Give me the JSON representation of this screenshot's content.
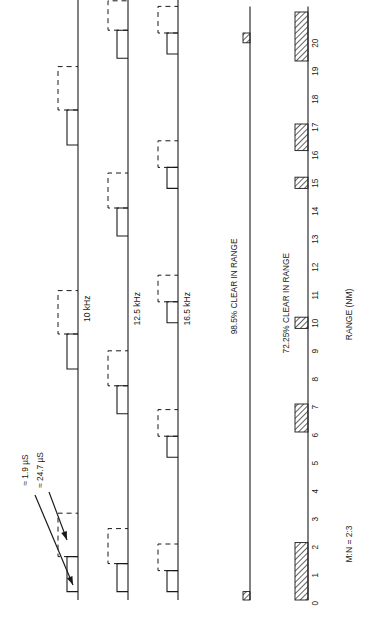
{
  "figure": {
    "orientation": "rotated-90-ccw",
    "axis_label": "RANGE (NM)",
    "ratio_note": "M:N = 2:3",
    "colors": {
      "ink": "#1a1a1a",
      "hatch": "#333333",
      "paper": "#ffffff"
    }
  },
  "annotations": [
    {
      "id": "pulse-width",
      "label": "≈ 1.9  µS"
    },
    {
      "id": "pulse-period",
      "label": "≈ 24.7 µS"
    }
  ],
  "traces": [
    {
      "name": "trace-10khz",
      "label": "10 kHz",
      "solid_pulses": [
        {
          "start": 0.3,
          "end": 1.55
        },
        {
          "start": 8.25,
          "end": 9.5
        },
        {
          "start": 16.25,
          "end": 17.5
        }
      ],
      "dashed_pulses": [
        {
          "start": 1.55,
          "end": 3.1
        },
        {
          "start": 9.5,
          "end": 11.05
        },
        {
          "start": 17.5,
          "end": 19.05
        }
      ]
    },
    {
      "name": "trace-12_5khz",
      "label": "12.5 kHz",
      "solid_pulses": [
        {
          "start": 0.3,
          "end": 1.3
        },
        {
          "start": 6.65,
          "end": 7.65
        },
        {
          "start": 13.0,
          "end": 14.0
        },
        {
          "start": 19.35,
          "end": 20.35
        }
      ],
      "dashed_pulses": [
        {
          "start": 1.3,
          "end": 2.55
        },
        {
          "start": 7.65,
          "end": 8.9
        },
        {
          "start": 14.0,
          "end": 15.25
        },
        {
          "start": 20.35,
          "end": 21.4
        }
      ]
    },
    {
      "name": "trace-16_5khz",
      "label": "16.5 kHz",
      "solid_pulses": [
        {
          "start": 0.3,
          "end": 1.05
        },
        {
          "start": 5.1,
          "end": 5.85
        },
        {
          "start": 9.9,
          "end": 10.65
        },
        {
          "start": 14.7,
          "end": 15.45
        },
        {
          "start": 19.5,
          "end": 20.25
        }
      ],
      "dashed_pulses": [
        {
          "start": 1.05,
          "end": 2.0
        },
        {
          "start": 5.85,
          "end": 6.8
        },
        {
          "start": 10.65,
          "end": 11.6
        },
        {
          "start": 15.45,
          "end": 16.4
        },
        {
          "start": 20.25,
          "end": 21.2
        }
      ]
    }
  ],
  "clear_bars": [
    {
      "name": "clear-98-5",
      "label": "98.5% CLEAR IN RANGE",
      "percent": 98.5,
      "blocked": [
        {
          "start": 0.0,
          "end": 0.3
        },
        {
          "start": 19.9,
          "end": 20.25
        }
      ]
    },
    {
      "name": "clear-72-25",
      "label": "72.25% CLEAR IN RANGE",
      "percent": 72.25,
      "blocked": [
        {
          "start": 0.0,
          "end": 2.05
        },
        {
          "start": 6.0,
          "end": 7.0
        },
        {
          "start": 9.7,
          "end": 10.1
        },
        {
          "start": 14.7,
          "end": 15.1
        },
        {
          "start": 16.05,
          "end": 17.0
        },
        {
          "start": 19.25,
          "end": 21.0
        }
      ]
    }
  ],
  "axis": {
    "name": "range-axis",
    "min": 0,
    "max": 20,
    "ticks": [
      "0",
      "1",
      "2",
      "3",
      "4",
      "5",
      "6",
      "7",
      "8",
      "9",
      "10",
      "11",
      "12",
      "13",
      "14",
      "15",
      "16",
      "17",
      "18",
      "19",
      "20"
    ]
  }
}
